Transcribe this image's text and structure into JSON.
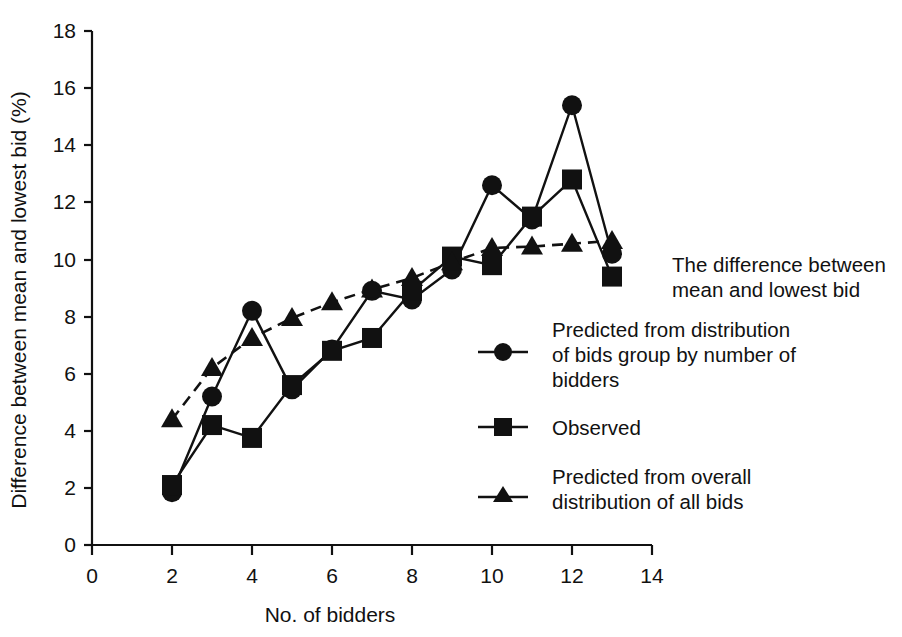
{
  "chart_data": {
    "type": "line",
    "title": "",
    "xlabel": "No. of bidders",
    "ylabel": "Difference between mean and lowest bid (%)",
    "xlim": [
      0,
      14
    ],
    "ylim": [
      0,
      18
    ],
    "xticks": [
      0,
      2,
      4,
      6,
      8,
      10,
      12,
      14
    ],
    "yticks": [
      0,
      2,
      4,
      6,
      8,
      10,
      12,
      14,
      16,
      18
    ],
    "grid": false,
    "legend_position": "right",
    "x": [
      2,
      3,
      4,
      5,
      6,
      7,
      8,
      9,
      10,
      11,
      12,
      13
    ],
    "series": [
      {
        "name": "Predicted from distribution of bids group by number of bidders",
        "marker": "circle",
        "linestyle": "solid",
        "values": [
          1.85,
          5.2,
          8.2,
          5.45,
          6.85,
          8.9,
          8.6,
          9.65,
          12.6,
          11.4,
          15.4,
          10.2
        ]
      },
      {
        "name": "Observed",
        "marker": "square",
        "linestyle": "solid",
        "values": [
          2.1,
          4.2,
          3.75,
          5.6,
          6.8,
          7.25,
          8.9,
          10.1,
          9.8,
          11.5,
          12.8,
          9.4
        ]
      },
      {
        "name": "Predicted from overall distribution of all bids",
        "marker": "triangle",
        "linestyle": "dashed",
        "values": [
          4.4,
          6.2,
          7.25,
          7.95,
          8.5,
          8.95,
          9.35,
          9.9,
          10.4,
          10.45,
          10.55,
          10.65
        ]
      }
    ]
  },
  "axes": {
    "x_title": "No. of bidders",
    "y_title": "Difference between mean and lowest bid (%)",
    "x_tick_labels": [
      "0",
      "2",
      "4",
      "6",
      "8",
      "10",
      "12",
      "14"
    ],
    "y_tick_labels": [
      "0",
      "2",
      "4",
      "6",
      "8",
      "10",
      "12",
      "14",
      "16",
      "18"
    ]
  },
  "legend": {
    "heading_line1": "The difference between",
    "heading_line2": "mean and lowest bid",
    "entries": [
      {
        "marker": "circle",
        "line1": "Predicted from distribution",
        "line2": "of bids group by number of",
        "line3": "bidders"
      },
      {
        "marker": "square",
        "line1": "Observed",
        "line2": "",
        "line3": ""
      },
      {
        "marker": "triangle",
        "line1": "Predicted from overall",
        "line2": "distribution of all bids",
        "line3": ""
      }
    ]
  },
  "colors": {
    "ink": "#111111",
    "background": "#ffffff"
  }
}
